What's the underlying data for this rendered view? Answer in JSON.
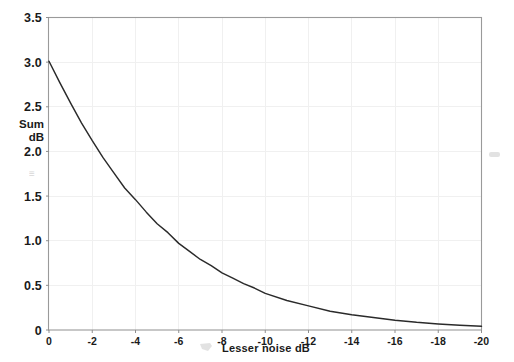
{
  "chart_data": {
    "type": "line",
    "title": "",
    "subtitle": "",
    "xlabel": "Lesser noise  dB",
    "ylabel_line1": "Sum",
    "ylabel_line2": "dB",
    "xlim": [
      0,
      -20
    ],
    "ylim": [
      0,
      3.5
    ],
    "x_ticks": [
      0,
      -2,
      -4,
      -6,
      -8,
      -10,
      -12,
      -14,
      -16,
      -18,
      -20
    ],
    "x_tick_labels": [
      "0",
      "-2",
      "-4",
      "-6",
      "-8",
      "-10",
      "-12",
      "-14",
      "-16",
      "-18",
      "-20"
    ],
    "y_ticks": [
      0,
      0.5,
      1.0,
      1.5,
      2.0,
      2.5,
      3.0,
      3.5
    ],
    "y_tick_labels": [
      "0",
      "0.5",
      "1.0",
      "1.5",
      "2.0",
      "2.5",
      "3.0",
      "3.5"
    ],
    "grid": true,
    "grid_color": "#f0f0f0",
    "legend": "none",
    "series": [
      {
        "name": "Decibel sum increment",
        "color": "#2a2a2a",
        "x": [
          0,
          -0.5,
          -1,
          -1.5,
          -2,
          -2.5,
          -3,
          -3.5,
          -4,
          -4.5,
          -5,
          -5.5,
          -6,
          -6.5,
          -7,
          -7.5,
          -8,
          -8.5,
          -9,
          -9.5,
          -10,
          -11,
          -12,
          -13,
          -14,
          -15,
          -16,
          -17,
          -18,
          -19,
          -20
        ],
        "values": [
          3.01,
          2.77,
          2.54,
          2.32,
          2.12,
          1.93,
          1.76,
          1.59,
          1.46,
          1.32,
          1.19,
          1.09,
          0.97,
          0.88,
          0.79,
          0.72,
          0.64,
          0.58,
          0.52,
          0.47,
          0.41,
          0.33,
          0.27,
          0.21,
          0.17,
          0.14,
          0.11,
          0.086,
          0.068,
          0.054,
          0.043
        ]
      }
    ],
    "annotations": [
      {
        "text": "(0, 3.0)",
        "note": "curve start at left axis"
      },
      {
        "text": "(-6, 1.0)",
        "note": "curve passes through one decibel"
      }
    ],
    "artifacts": [
      {
        "name": "y-axis-smudge",
        "text": "≡",
        "x": 34,
        "y": 174
      },
      {
        "name": "x-axis-smudge",
        "x": 205,
        "y": 345
      },
      {
        "name": "right-margin-smudge",
        "x": 494,
        "y": 156
      }
    ]
  },
  "colors": {
    "background": "#ffffff",
    "frame": "#9a9a9a",
    "grid": "#f0f0f0",
    "curve": "#2a2a2a",
    "text": "#1a1a1a"
  }
}
